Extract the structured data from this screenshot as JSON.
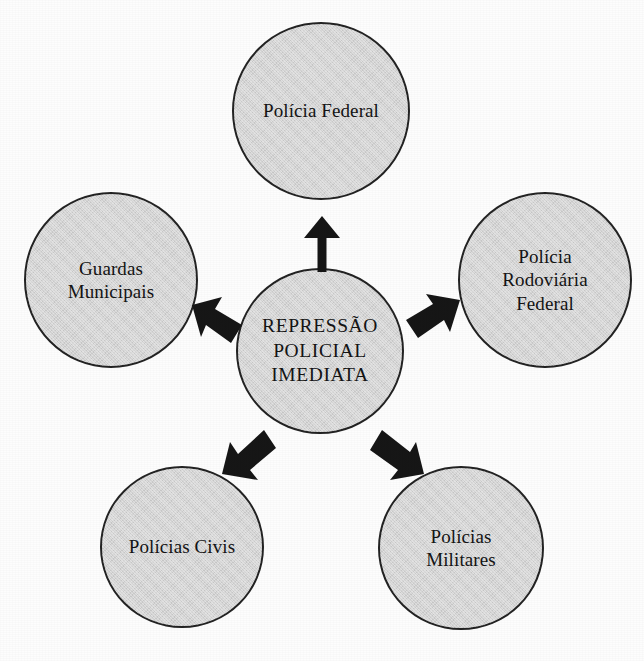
{
  "diagram": {
    "type": "hub-and-spoke",
    "title": "REPRESSÃO POLICIAL IMEDIATA",
    "fill_color": "#d4d4d4",
    "stroke_color": "#232323",
    "arrow_color": "#161616",
    "background_color": "#ffffff",
    "center": {
      "id": "repressao-policial-imediata",
      "lines": [
        "REPRESSÃO",
        "POLICIAL",
        "IMEDIATA"
      ]
    },
    "nodes": [
      {
        "id": "policia-federal",
        "position": "top",
        "lines": [
          "Polícia Federal"
        ]
      },
      {
        "id": "guardas-municipais",
        "position": "left",
        "lines": [
          "Guardas",
          "Municipais"
        ]
      },
      {
        "id": "policia-rodoviaria-federal",
        "position": "right",
        "lines": [
          "Polícia",
          "Rodoviária",
          "Federal"
        ]
      },
      {
        "id": "policias-civis",
        "position": "bottom-left",
        "lines": [
          "Polícias Civis"
        ]
      },
      {
        "id": "policias-militares",
        "position": "bottom-right",
        "lines": [
          "Polícias",
          "Militares"
        ]
      }
    ],
    "arrows": [
      {
        "id": "arrow-to-policia-federal",
        "from": "repressao-policial-imediata",
        "to": "policia-federal",
        "direction": "up",
        "style": "shafted"
      },
      {
        "id": "arrow-to-guardas-municipais",
        "from": "repressao-policial-imediata",
        "to": "guardas-municipais",
        "direction": "up-left",
        "style": "chevron"
      },
      {
        "id": "arrow-to-policia-rodoviaria-federal",
        "from": "repressao-policial-imediata",
        "to": "policia-rodoviaria-federal",
        "direction": "up-right",
        "style": "chevron"
      },
      {
        "id": "arrow-to-policias-civis",
        "from": "repressao-policial-imediata",
        "to": "policias-civis",
        "direction": "down-left",
        "style": "chevron"
      },
      {
        "id": "arrow-to-policias-militares",
        "from": "repressao-policial-imediata",
        "to": "policias-militares",
        "direction": "down-right",
        "style": "chevron"
      }
    ]
  }
}
